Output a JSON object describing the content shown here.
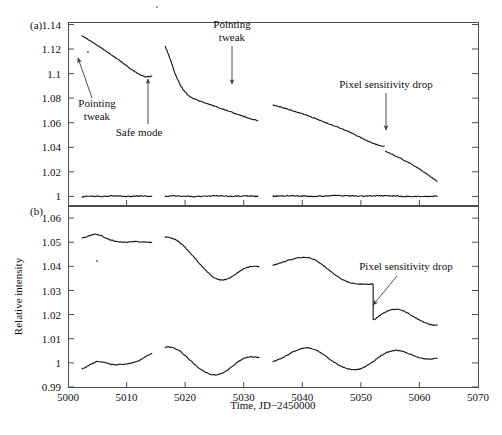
{
  "figure": {
    "panel_a_label": "(a)",
    "panel_b_label": "(b)",
    "ylabel": "Relative intensity",
    "xlabel": "Time, JD−2450000",
    "line_color": "#1a1a1a",
    "frame_color": "#4d4d4d",
    "annotation_color": "#3a3a3a"
  },
  "annotations": {
    "a_pointing_tweak_1_line1": "Pointing",
    "a_pointing_tweak_1_line2": "tweak",
    "a_safe_mode": "Safe mode",
    "a_pointing_tweak_2_line1": "Pointing",
    "a_pointing_tweak_2_line2": "tweak",
    "a_pixel_drop": "Pixel sensitivity drop",
    "b_pixel_drop": "Pixel sensitivity drop"
  },
  "chart_data": {
    "type": "line",
    "title": "",
    "xlabel": "Time, JD−2450000",
    "ylabel": "Relative intensity",
    "xlim": [
      5000,
      5070
    ],
    "xticks": [
      5000,
      5010,
      5020,
      5030,
      5040,
      5050,
      5060,
      5070
    ],
    "xticklabels": [
      "5000",
      "5010",
      "5020",
      "5030",
      "5040",
      "5050",
      "5060",
      "5070"
    ],
    "grid": false,
    "legend": "none",
    "panels": [
      {
        "label": "(a)",
        "ylim": [
          0.993,
          1.142
        ],
        "yticks": [
          1,
          1.02,
          1.04,
          1.06,
          1.08,
          1.1,
          1.12,
          1.14
        ],
        "yticklabels": [
          "1",
          "1.02",
          "1.04",
          "1.06",
          "1.08",
          "1.1",
          "1.12",
          "1.14"
        ],
        "series": [
          {
            "name": "target-raw",
            "segments": [
              {
                "x": [
                  5002.4,
                  5003.0,
                  5003.6,
                  5004.2,
                  5004.8,
                  5005.4,
                  5006.0,
                  5006.6,
                  5007.2,
                  5007.8,
                  5008.4,
                  5009.0,
                  5009.6,
                  5010.2,
                  5010.8,
                  5011.4,
                  5012.0,
                  5012.6,
                  5013.2,
                  5013.8,
                  5014.3
                ],
                "y": [
                  1.1305,
                  1.129,
                  1.1272,
                  1.1256,
                  1.1238,
                  1.1219,
                  1.12,
                  1.118,
                  1.116,
                  1.114,
                  1.112,
                  1.11,
                  1.1078,
                  1.1056,
                  1.1035,
                  1.1016,
                  1.1,
                  1.0985,
                  1.0975,
                  1.0975,
                  1.098
                ]
              },
              {
                "x": [
                  5016.6,
                  5017.0,
                  5017.4,
                  5017.8,
                  5018.2,
                  5018.7,
                  5019.2,
                  5019.8,
                  5020.4,
                  5021.0,
                  5021.8,
                  5022.6,
                  5023.4,
                  5024.4,
                  5025.4,
                  5026.6,
                  5027.8,
                  5029.0,
                  5030.2,
                  5031.4,
                  5032.4
                ],
                "y": [
                  1.122,
                  1.1175,
                  1.1125,
                  1.107,
                  1.101,
                  1.0955,
                  1.0905,
                  1.0862,
                  1.083,
                  1.0808,
                  1.079,
                  1.0775,
                  1.0762,
                  1.0745,
                  1.0728,
                  1.0708,
                  1.0688,
                  1.0668,
                  1.0648,
                  1.063,
                  1.0618
                ]
              },
              {
                "x": [
                  5035.0,
                  5036.2,
                  5037.4,
                  5038.6,
                  5039.8,
                  5041.0,
                  5042.2,
                  5043.4,
                  5044.6,
                  5045.8,
                  5047.0,
                  5048.2,
                  5049.4,
                  5050.6,
                  5051.8,
                  5053.0,
                  5054.0
                ],
                "y": [
                  1.0745,
                  1.073,
                  1.0712,
                  1.0694,
                  1.0676,
                  1.0656,
                  1.0634,
                  1.0612,
                  1.059,
                  1.0568,
                  1.0546,
                  1.052,
                  1.0492,
                  1.0464,
                  1.0438,
                  1.0418,
                  1.0408
                ]
              },
              {
                "x": [
                  5054.2,
                  5055.2,
                  5056.4,
                  5057.6,
                  5058.8,
                  5060.0,
                  5061.2,
                  5062.2,
                  5063.0
                ],
                "y": [
                  1.0368,
                  1.0345,
                  1.0318,
                  1.029,
                  1.0258,
                  1.0222,
                  1.0185,
                  1.015,
                  1.0125
                ]
              }
            ]
          },
          {
            "name": "comparison-flat",
            "segments": [
              {
                "x": [
                  5002.4,
                  5004,
                  5006,
                  5008,
                  5010,
                  5012,
                  5014.3
                ],
                "y": [
                  0.9995,
                  1.0003,
                  1.0,
                  1.0005,
                  1.0,
                  1.0004,
                  1.0001
                ]
              },
              {
                "x": [
                  5016.6,
                  5019,
                  5022,
                  5025,
                  5028,
                  5031,
                  5032.4
                ],
                "y": [
                  1.0,
                  1.0004,
                  0.9999,
                  1.0005,
                  1.0001,
                  1.0004,
                  1.0
                ]
              },
              {
                "x": [
                  5035,
                  5038,
                  5042,
                  5046,
                  5050,
                  5054,
                  5058,
                  5063
                ],
                "y": [
                  1.0002,
                  1.0005,
                  1.0,
                  1.0006,
                  1.0002,
                  1.0006,
                  1.0,
                  1.0002
                ]
              }
            ]
          }
        ],
        "events": [
          {
            "name": "pointing-tweak",
            "x": 5003.5,
            "y": 1.121
          },
          {
            "name": "safe-mode",
            "x": 5015.5,
            "y": 1.085
          },
          {
            "name": "pointing-tweak",
            "x": 5034.5,
            "y": 1.077
          },
          {
            "name": "pixel-sensitivity-drop",
            "x": 5054.0,
            "y": 1.042
          }
        ]
      },
      {
        "label": "(b)",
        "ylim": [
          0.99,
          1.065
        ],
        "yticks": [
          0.99,
          1,
          1.01,
          1.02,
          1.03,
          1.04,
          1.05,
          1.06
        ],
        "yticklabels": [
          "0.99",
          "1",
          "1.01",
          "1.02",
          "1.03",
          "1.04",
          "1.05",
          "1.06"
        ],
        "series": [
          {
            "name": "detrended-upper",
            "segments": [
              {
                "x": [
                  5002.4,
                  5003.2,
                  5004.0,
                  5004.8,
                  5005.6,
                  5006.4,
                  5007.2,
                  5008.2,
                  5009.2,
                  5010.2,
                  5011.2,
                  5012.2,
                  5013.2,
                  5014.3
                ],
                "y": [
                  1.0518,
                  1.0522,
                  1.053,
                  1.0532,
                  1.0528,
                  1.0518,
                  1.051,
                  1.0504,
                  1.0501,
                  1.05,
                  1.0503,
                  1.0502,
                  1.05,
                  1.05
                ]
              },
              {
                "x": [
                  5016.6,
                  5017.4,
                  5018.2,
                  5019.0,
                  5020.0,
                  5021.0,
                  5022.0,
                  5023.0,
                  5024.0,
                  5025.0,
                  5026.0,
                  5027.0,
                  5028.0,
                  5029.0,
                  5030.0,
                  5031.0,
                  5032.0,
                  5032.6
                ],
                "y": [
                  1.0522,
                  1.0519,
                  1.0512,
                  1.05,
                  1.0478,
                  1.0452,
                  1.0424,
                  1.0396,
                  1.0372,
                  1.0352,
                  1.0344,
                  1.0346,
                  1.0358,
                  1.0374,
                  1.039,
                  1.0398,
                  1.04,
                  1.0398
                ]
              },
              {
                "x": [
                  5035.0,
                  5036.0,
                  5037.0,
                  5038.0,
                  5039.0,
                  5040.0,
                  5041.0,
                  5042.0,
                  5043.0,
                  5044.0,
                  5045.0,
                  5046.0,
                  5047.0,
                  5048.0,
                  5049.0,
                  5050.0,
                  5051.0,
                  5052.0
                ],
                "y": [
                  1.0405,
                  1.0412,
                  1.042,
                  1.0428,
                  1.0434,
                  1.0437,
                  1.0436,
                  1.0428,
                  1.0414,
                  1.0396,
                  1.0376,
                  1.0358,
                  1.0344,
                  1.0334,
                  1.0328,
                  1.0326,
                  1.0326,
                  1.0327
                ]
              },
              {
                "x": [
                  5052.2,
                  5053.0,
                  5054.0,
                  5055.0,
                  5056.0,
                  5057.0,
                  5058.0,
                  5059.0,
                  5060.0,
                  5061.0,
                  5062.0,
                  5063.0
                ],
                "y": [
                  1.0178,
                  1.0192,
                  1.0208,
                  1.0218,
                  1.0222,
                  1.0218,
                  1.0206,
                  1.0192,
                  1.0178,
                  1.0166,
                  1.0158,
                  1.0155
                ]
              }
            ]
          },
          {
            "name": "detrended-lower",
            "segments": [
              {
                "x": [
                  5002.4,
                  5003.2,
                  5004.0,
                  5005.0,
                  5006.0,
                  5007.0,
                  5008.0,
                  5009.0,
                  5010.0,
                  5011.0,
                  5012.0,
                  5013.0,
                  5014.3
                ],
                "y": [
                  0.9975,
                  0.9985,
                  0.9995,
                  1.0005,
                  1.0003,
                  0.9996,
                  0.9992,
                  0.9994,
                  0.9996,
                  1.0,
                  1.0008,
                  1.0022,
                  1.0038
                ]
              },
              {
                "x": [
                  5016.6,
                  5017.2,
                  5018.0,
                  5019.0,
                  5020.0,
                  5021.0,
                  5022.0,
                  5023.0,
                  5024.0,
                  5025.0,
                  5026.0,
                  5027.0,
                  5028.0,
                  5029.0,
                  5030.0,
                  5031.0,
                  5032.0,
                  5032.6
                ],
                "y": [
                  1.0064,
                  1.0066,
                  1.0062,
                  1.005,
                  1.003,
                  1.0008,
                  0.9986,
                  0.9968,
                  0.9956,
                  0.995,
                  0.9954,
                  0.9966,
                  0.9984,
                  1.0004,
                  1.0018,
                  1.0024,
                  1.0024,
                  1.0022
                ]
              },
              {
                "x": [
                  5035.0,
                  5036.0,
                  5037.0,
                  5038.0,
                  5039.0,
                  5040.0,
                  5041.0,
                  5042.0,
                  5043.0,
                  5044.0,
                  5045.0,
                  5046.0,
                  5047.0,
                  5048.0,
                  5049.0,
                  5050.0,
                  5051.0,
                  5052.0,
                  5053.0,
                  5054.0,
                  5055.0,
                  5056.0,
                  5057.0,
                  5058.0,
                  5059.0,
                  5060.0,
                  5061.0,
                  5062.0,
                  5063.0
                ],
                "y": [
                  1.0006,
                  1.0014,
                  1.0026,
                  1.004,
                  1.0052,
                  1.006,
                  1.0062,
                  1.0056,
                  1.0044,
                  1.0028,
                  1.001,
                  0.9994,
                  0.9982,
                  0.9974,
                  0.9972,
                  0.9976,
                  0.9988,
                  1.0004,
                  1.0022,
                  1.0038,
                  1.0048,
                  1.0052,
                  1.0048,
                  1.004,
                  1.003,
                  1.0022,
                  1.0016,
                  1.0016,
                  1.002
                ]
              }
            ]
          }
        ],
        "events": [
          {
            "name": "pixel-sensitivity-drop",
            "x": 5052.1,
            "y": 1.0327
          }
        ]
      }
    ]
  }
}
